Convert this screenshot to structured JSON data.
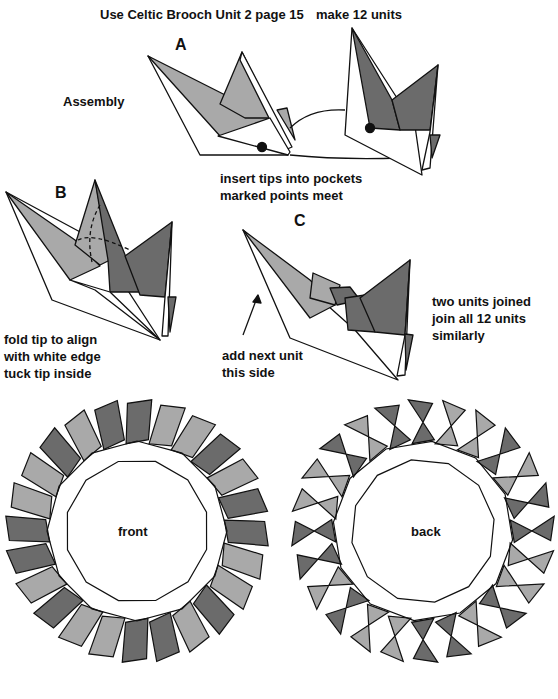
{
  "header": {
    "title": "Use Celtic Brooch Unit 2 page 15",
    "units_note": "make 12 units"
  },
  "step_a": {
    "label": "A",
    "section": "Assembly",
    "caption_1": "insert tips into pockets",
    "caption_2": "marked points meet"
  },
  "step_b": {
    "label": "B",
    "caption_1": "fold tip to align",
    "caption_2": "with white edge",
    "caption_3": "tuck tip inside"
  },
  "step_c": {
    "label": "C",
    "arrow_note_1": "add next unit",
    "arrow_note_2": "this side",
    "side_note_1": "two units joined",
    "side_note_2": "join all 12 units",
    "side_note_3": "similarly"
  },
  "results": {
    "front_label": "front",
    "back_label": "back",
    "unit_count": 12
  },
  "colors": {
    "light": "#a9a9a9",
    "dark": "#6b6b6b",
    "line": "#111111"
  }
}
